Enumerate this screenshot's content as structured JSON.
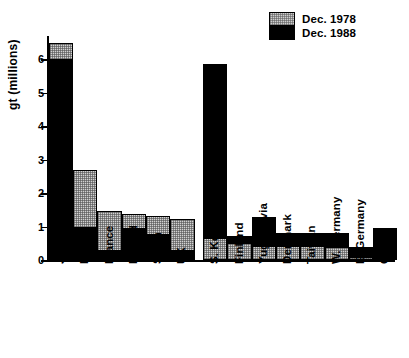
{
  "chart_data": {
    "type": "bar",
    "subtype": "overlaid-two-series",
    "title": "",
    "xlabel": "",
    "ylabel": "gt (millions)",
    "ylim": [
      0,
      6.7
    ],
    "ytick_labels": [
      "0",
      "1",
      "2",
      "3",
      "4",
      "5",
      "6"
    ],
    "ytick_values": [
      0,
      1,
      2,
      3,
      4,
      5,
      6
    ],
    "grid": false,
    "legend_position": "top-right",
    "categories": [
      "Japan",
      "Brazil",
      "France",
      "Poland",
      "Spain",
      "UK",
      "S. Korea",
      "Finland",
      "Yugoslavia",
      "Denmark",
      "Taiwan",
      "W. Germany",
      "E. Germany",
      "China"
    ],
    "series": [
      {
        "name": "Dec. 1978",
        "color": "#d2d2d2",
        "values": [
          6.5,
          2.7,
          1.47,
          1.38,
          1.32,
          1.22,
          0.67,
          0.52,
          0.43,
          0.43,
          0.42,
          0.4,
          0.1,
          0.0
        ]
      },
      {
        "name": "Dec. 1988",
        "color": "#000000",
        "values": [
          6.0,
          1.0,
          0.3,
          0.95,
          0.78,
          0.3,
          5.85,
          0.72,
          1.28,
          0.82,
          0.82,
          0.82,
          0.4,
          0.95
        ]
      }
    ]
  },
  "legend": {
    "items": [
      {
        "label": "Dec. 1978",
        "swatch": "gray-stipple"
      },
      {
        "label": "Dec. 1988",
        "swatch": "black-solid"
      }
    ]
  },
  "axes": {
    "y_title": "gt (millions)",
    "y_ticks": [
      "6",
      "5",
      "4",
      "3",
      "2",
      "1",
      "0"
    ]
  }
}
